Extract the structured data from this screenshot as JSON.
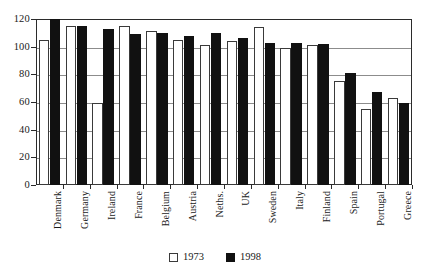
{
  "chart_data": {
    "type": "bar",
    "title": "",
    "subtitle": "",
    "xlabel": "",
    "ylabel": "",
    "ylim": [
      0,
      120
    ],
    "yticks": [
      0,
      20,
      40,
      60,
      80,
      100,
      120
    ],
    "grid": true,
    "legend_position": "bottom-center",
    "categories": [
      "Denmark",
      "Germany",
      "Ireland",
      "France",
      "Belgium",
      "Austria",
      "Neths.",
      "UK",
      "Sweden",
      "Italy",
      "Finland",
      "Spain",
      "Portugal",
      "Greece"
    ],
    "series": [
      {
        "name": "1973",
        "color": "#ffffff",
        "values": [
          105,
          115,
          59,
          115,
          111,
          105,
          101,
          104,
          114,
          99,
          101,
          75,
          55,
          63
        ]
      },
      {
        "name": "1998",
        "color": "#111111",
        "values": [
          120,
          115,
          113,
          109,
          110,
          108,
          110,
          106,
          103,
          103,
          102,
          81,
          67,
          59
        ]
      }
    ]
  },
  "legend": {
    "items": [
      {
        "label": "1973",
        "swatch": "white"
      },
      {
        "label": "1998",
        "swatch": "black"
      }
    ]
  }
}
